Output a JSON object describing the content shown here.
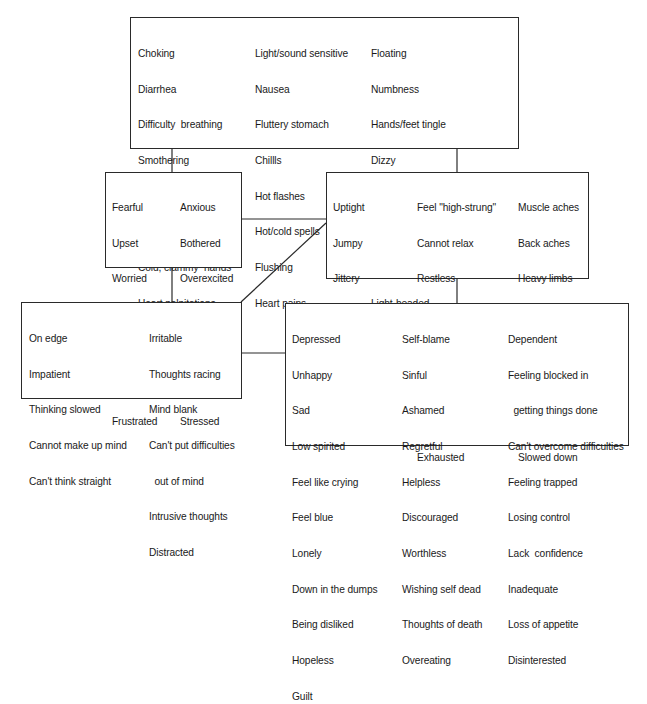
{
  "diagram": {
    "title": "",
    "boxes": {
      "physical": {
        "columns": [
          [
            "Choking",
            "Diarrhea",
            "Difficulty  breathing",
            "Smothering",
            "Lump in throat",
            "Dry  mouth",
            "Cold, clammy  hands",
            "Heart palpitations"
          ],
          [
            "Light/sound sensitive",
            "Nausea",
            "Fluttery stomach",
            "Chillls",
            "Hot flashes",
            "Hot/cold spells",
            "Flushing",
            "Heart pains"
          ],
          [
            "Floating",
            "Numbness",
            "Hands/feet tingle",
            "Dizzy",
            "Off-balance",
            "Unsteady",
            "Rubbery, \"jelly legs\"",
            "Light-headed",
            "Heart pounding, skipping, racing"
          ]
        ]
      },
      "emotional": {
        "columns": [
          [
            "Fearful",
            "Upset",
            "Worried",
            "Troubled",
            "Nervous",
            "Shook-up",
            "Frustrated"
          ],
          [
            "Anxious",
            "Bothered",
            "Overexcited",
            "Rattled",
            "Uneasy",
            "Overactive",
            "Stressed"
          ]
        ]
      },
      "tension": {
        "columns": [
          [
            "Uptight",
            "Jumpy",
            "Jittery",
            "Tense",
            "Keyed up",
            "Handwringing",
            "Nailbiting"
          ],
          [
            "Feel \"high-strung\"",
            "Cannot relax",
            "Restless",
            "Fidgety",
            "Easily startled",
            "Trembling",
            "Shakiness",
            "Exhausted"
          ],
          [
            "Muscle aches",
            "Back aches",
            "Heavy limbs",
            "Tired",
            "Weak",
            "Fatigued",
            "Low energy",
            "Slowed down"
          ]
        ]
      },
      "cognitive": {
        "columns": [
          [
            "On edge",
            "Impatient",
            "Thinking slowed",
            "Cannot make up mind",
            "Can't think straight"
          ],
          [
            "Irritable",
            "Thoughts racing",
            "Mind blank",
            "Can't put difficulties",
            "  out of mind",
            "Intrusive thoughts",
            "Distracted"
          ]
        ]
      },
      "depressive": {
        "columns": [
          [
            "Depressed",
            "Unhappy",
            "Sad",
            "Low spirited",
            "Feel like crying",
            "Feel blue",
            "Lonely",
            "Down in the dumps",
            "Being disliked",
            "Hopeless",
            "Guilt"
          ],
          [
            "Self-blame",
            "Sinful",
            "Ashamed",
            "Regretful",
            "Helpless",
            "Discouraged",
            "Worthless",
            "Wishing self dead",
            "Thoughts of death",
            "Overeating"
          ],
          [
            "Dependent",
            "Feeling blocked in",
            "  getting things done",
            "Can't overcome difficulties",
            "Feeling trapped",
            "Losing control",
            "Lack  confidence",
            "Inadequate",
            "Loss of appetite",
            "Disinterested"
          ]
        ]
      }
    },
    "colors": {
      "line": "#2a2a2a",
      "text": "#1a1a1a",
      "background": "#ffffff"
    }
  }
}
